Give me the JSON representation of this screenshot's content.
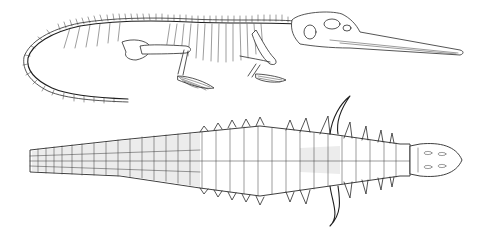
{
  "figure": {
    "panels": [
      {
        "id": "skeleton",
        "view": "lateral skeleton with long narrow snout and curved tail"
      },
      {
        "id": "armor",
        "view": "dorsal view of armor plates with lateral spikes and large shoulder horns"
      }
    ],
    "colors": {
      "ink": "#2a2a2a",
      "background": "#ffffff",
      "stipple": "#ececec"
    }
  }
}
